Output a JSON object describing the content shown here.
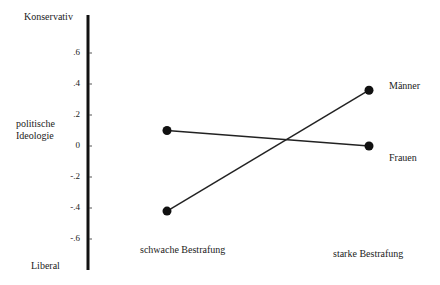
{
  "chart_data": {
    "type": "line",
    "title": "",
    "ylabel": "politische Ideologie",
    "ylabel_lines": [
      "politische",
      "Ideologie"
    ],
    "y_top_label": "Konservativ",
    "y_bottom_label": "Liberal",
    "xlabel": "",
    "categories": [
      "schwache Bestrafung",
      "starke Bestrafung"
    ],
    "yticks": [
      ".6",
      ".4",
      ".2",
      "0",
      "-.2",
      "-.4",
      "-.6"
    ],
    "ytick_values": [
      0.6,
      0.4,
      0.2,
      0,
      -0.2,
      -0.4,
      -0.6
    ],
    "ylim": [
      -0.8,
      0.85
    ],
    "grid": false,
    "legend_position": "inline-right",
    "series": [
      {
        "name": "Männer",
        "values": [
          -0.42,
          0.36
        ]
      },
      {
        "name": "Frauen",
        "values": [
          0.1,
          0.0
        ]
      }
    ]
  },
  "colors": {
    "line": "#222222",
    "marker": "#111111",
    "axis": "#111111"
  }
}
